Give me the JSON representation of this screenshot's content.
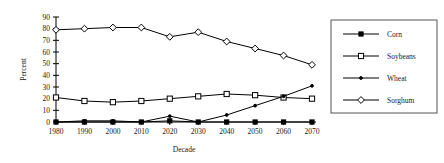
{
  "chart_data": {
    "type": "line",
    "title": "",
    "xlabel": "Decade",
    "ylabel": "Percent",
    "categories": [
      "1980",
      "1990",
      "2000",
      "2010",
      "2020",
      "2030",
      "2040",
      "2050",
      "2060",
      "2070"
    ],
    "x": [
      1980,
      1990,
      2000,
      2010,
      2020,
      2030,
      2040,
      2050,
      2060,
      2070
    ],
    "xlim": [
      1980,
      2070
    ],
    "ylim": [
      0,
      90
    ],
    "yticks": [
      0,
      10,
      20,
      30,
      40,
      50,
      60,
      70,
      80,
      90
    ],
    "grid": false,
    "legend_position": "right",
    "series": [
      {
        "name": "Corn",
        "marker": "filled-square",
        "values": [
          0,
          0,
          0,
          0,
          1,
          0,
          0,
          0,
          0,
          0
        ]
      },
      {
        "name": "Soybeans",
        "marker": "open-square",
        "values": [
          21,
          18,
          17,
          18,
          20,
          22,
          24,
          23,
          21,
          20
        ]
      },
      {
        "name": "Wheat",
        "marker": "small-dot",
        "values": [
          0,
          1,
          1,
          0,
          5,
          0,
          6,
          14,
          22,
          31
        ]
      },
      {
        "name": "Sorghum",
        "marker": "open-diamond",
        "values": [
          79,
          80,
          81,
          81,
          73,
          77,
          69,
          63,
          57,
          49
        ]
      }
    ]
  },
  "legend": {
    "entries": [
      {
        "label": "Corn"
      },
      {
        "label": "Soybeans"
      },
      {
        "label": "Wheat"
      },
      {
        "label": "Sorghum"
      }
    ]
  }
}
